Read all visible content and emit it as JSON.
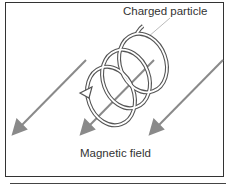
{
  "labels": {
    "particle": "Charged particle",
    "field": "Magnetic field"
  },
  "colors": {
    "arrow": "#8a8a8a",
    "helix": "#555555",
    "border": "#333333"
  }
}
